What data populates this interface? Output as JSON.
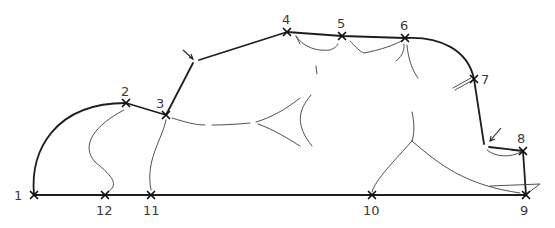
{
  "diagram": {
    "type": "outline-landmark-drawing",
    "points": [
      {
        "id": "1",
        "label": "1",
        "x": 34,
        "y": 195,
        "lx": 14,
        "ly": 200
      },
      {
        "id": "2",
        "label": "2",
        "x": 126,
        "y": 103,
        "lx": 121,
        "ly": 96
      },
      {
        "id": "3",
        "label": "3",
        "x": 166,
        "y": 115,
        "lx": 156,
        "ly": 108
      },
      {
        "id": "4",
        "label": "4",
        "x": 287,
        "y": 32,
        "lx": 282,
        "ly": 24
      },
      {
        "id": "5",
        "label": "5",
        "x": 342,
        "y": 36,
        "lx": 337,
        "ly": 28
      },
      {
        "id": "6",
        "label": "6",
        "x": 405,
        "y": 38,
        "lx": 400,
        "ly": 30
      },
      {
        "id": "7",
        "label": "7",
        "x": 474,
        "y": 79,
        "lx": 481,
        "ly": 84
      },
      {
        "id": "8",
        "label": "8",
        "x": 523,
        "y": 151,
        "lx": 517,
        "ly": 143
      },
      {
        "id": "9",
        "label": "9",
        "x": 526,
        "y": 195,
        "lx": 520,
        "ly": 215
      },
      {
        "id": "10",
        "label": "10",
        "x": 372,
        "y": 195,
        "lx": 363,
        "ly": 215
      },
      {
        "id": "11",
        "label": "11",
        "x": 151,
        "y": 195,
        "lx": 143,
        "ly": 215
      },
      {
        "id": "12",
        "label": "12",
        "x": 105,
        "y": 195,
        "lx": 96,
        "ly": 215
      }
    ],
    "unmarked_vertices": [
      {
        "name": "upper-arrow-vertex",
        "x": 196,
        "y": 60
      },
      {
        "name": "lower-arrow-vertex",
        "x": 486,
        "y": 146
      }
    ],
    "colors": {
      "background": "#ffffff",
      "outline": "#1e1e1e",
      "contour": "#3c3c3c",
      "label": "#3a3a3a"
    }
  }
}
